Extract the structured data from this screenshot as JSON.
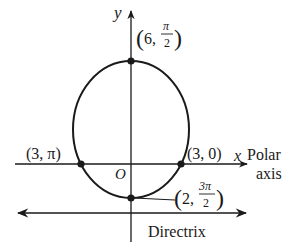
{
  "diagram": {
    "type": "polar conic (ellipse) with directrix",
    "axes": {
      "y_label": "y",
      "x_label": "x",
      "polar_axis_label_line1": "Polar",
      "polar_axis_label_line2": "axis",
      "origin_label": "O"
    },
    "directrix_label": "Directrix",
    "points": [
      {
        "name": "top",
        "r": "6",
        "theta_num": "π",
        "theta_den": "2",
        "label_open": "(6, ",
        "label_close": ")"
      },
      {
        "name": "left",
        "label": "(3, π)"
      },
      {
        "name": "right",
        "label": "(3, 0)"
      },
      {
        "name": "bottom",
        "r": "2",
        "theta_num": "3π",
        "theta_den": "2",
        "label_open": "(2, ",
        "label_close": ")"
      }
    ],
    "colors": {
      "stroke": "#1a1a1a",
      "background": "#ffffff"
    }
  }
}
